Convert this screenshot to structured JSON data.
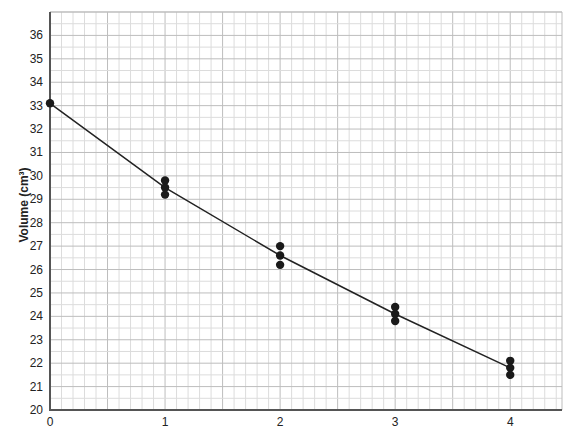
{
  "chart_data": {
    "type": "scatter",
    "title": "",
    "xlabel": "",
    "ylabel": "Volume (cm³)",
    "xlim": [
      0,
      4.45
    ],
    "ylim": [
      20,
      37
    ],
    "x_ticks": [
      0,
      1,
      2,
      3,
      4
    ],
    "y_ticks": [
      20,
      21,
      22,
      23,
      24,
      25,
      26,
      27,
      28,
      29,
      30,
      31,
      32,
      33,
      34,
      35,
      36
    ],
    "grid": true,
    "legend": null,
    "series": [
      {
        "name": "measurements",
        "kind": "scatter",
        "points": [
          {
            "x": 0,
            "y": 33.1
          },
          {
            "x": 1,
            "y": 29.8
          },
          {
            "x": 1,
            "y": 29.5
          },
          {
            "x": 1,
            "y": 29.2
          },
          {
            "x": 2,
            "y": 27.0
          },
          {
            "x": 2,
            "y": 26.6
          },
          {
            "x": 2,
            "y": 26.2
          },
          {
            "x": 3,
            "y": 24.4
          },
          {
            "x": 3,
            "y": 24.1
          },
          {
            "x": 3,
            "y": 23.8
          },
          {
            "x": 4,
            "y": 22.1
          },
          {
            "x": 4,
            "y": 21.8
          },
          {
            "x": 4,
            "y": 21.5
          }
        ]
      },
      {
        "name": "best-fit line",
        "kind": "line",
        "points": [
          {
            "x": 0,
            "y": 33.1
          },
          {
            "x": 1,
            "y": 29.5
          },
          {
            "x": 2,
            "y": 26.6
          },
          {
            "x": 3,
            "y": 24.1
          },
          {
            "x": 4,
            "y": 21.8
          }
        ]
      }
    ]
  },
  "colors": {
    "axis": "#555555",
    "grid_major": "#bdbdbd",
    "grid_minor": "#dcdcdc",
    "points": "#1a1a1a",
    "line": "#222222",
    "text": "#222222"
  }
}
